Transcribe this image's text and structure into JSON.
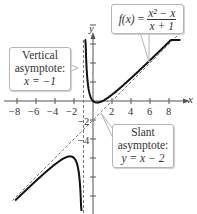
{
  "function": {
    "name": "f(x)",
    "numerator": "x² − x",
    "denominator": "x + 1"
  },
  "axes": {
    "x_label": "x",
    "y_label": "y",
    "x_tick_labels": [
      "−8",
      "−6",
      "−4",
      "−2",
      "2",
      "4",
      "6",
      "8"
    ],
    "y_tick_labels": [
      "−2",
      "−4"
    ]
  },
  "callouts": {
    "vertical": {
      "line1": "Vertical",
      "line2": "asymptote:",
      "line3": "x = −1"
    },
    "slant": {
      "line1": "Slant",
      "line2": "asymptote:",
      "line3": "y = x − 2"
    }
  },
  "colors": {
    "curve": "#111111",
    "asymptote": "#7a7a7a",
    "axis": "#555555",
    "callout_border": "#b5b5b5"
  },
  "chart_data": {
    "type": "line",
    "xlabel": "x",
    "ylabel": "y",
    "xlim": [
      -8.5,
      9.5
    ],
    "ylim": [
      -11.5,
      10.5
    ],
    "x_ticks": [
      -8,
      -6,
      -4,
      -2,
      2,
      4,
      6,
      8
    ],
    "y_tick_labels": [
      -2,
      -4
    ],
    "grid": false,
    "series": [
      {
        "name": "f(x) right branch",
        "style": "solid",
        "x": [
          -0.92,
          -0.8,
          -0.6,
          -0.4,
          -0.2,
          0,
          0.41,
          1,
          2,
          4,
          6,
          8,
          9
        ],
        "y": [
          23.0,
          7.2,
          2.4,
          0.93,
          0.3,
          0,
          -0.17,
          0,
          0.67,
          2.4,
          4.29,
          6.22,
          7.2
        ]
      },
      {
        "name": "f(x) left branch",
        "style": "solid",
        "x": [
          -8.5,
          -7,
          -6,
          -5,
          -4,
          -3,
          -2.41,
          -2,
          -1.6,
          -1.3,
          -1.1
        ],
        "y": [
          -11.13,
          -9.33,
          -8.4,
          -7.5,
          -6.67,
          -6.0,
          -5.83,
          -6.0,
          -6.93,
          -9.97,
          -23.1
        ]
      },
      {
        "name": "Vertical asymptote x = −1",
        "style": "dashed",
        "x": [
          -1,
          -1
        ],
        "y": [
          -11.5,
          10.5
        ]
      },
      {
        "name": "Slant asymptote y = x − 2",
        "style": "dashed",
        "x": [
          -8.5,
          9.5
        ],
        "y": [
          -10.5,
          7.5
        ]
      }
    ],
    "annotations": [
      "f(x) = (x² − x)/(x + 1)",
      "Vertical asymptote: x = −1",
      "Slant asymptote: y = x − 2"
    ]
  }
}
